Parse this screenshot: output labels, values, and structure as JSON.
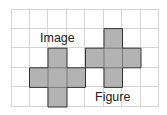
{
  "grid": {
    "columns": 8,
    "rows": 5,
    "origin_x": 11,
    "origin_y": 9,
    "cell_w": 18.5,
    "cell_h": 19.6,
    "line_color": "#d4d4d4"
  },
  "shapes": [
    {
      "name": "image-cross",
      "fill": "#b3b3b3",
      "stroke": "#333333",
      "cells": [
        [
          2,
          2
        ],
        [
          1,
          3
        ],
        [
          2,
          3
        ],
        [
          3,
          3
        ],
        [
          2,
          4
        ]
      ]
    },
    {
      "name": "figure-cross",
      "fill": "#b3b3b3",
      "stroke": "#333333",
      "cells": [
        [
          5,
          1
        ],
        [
          4,
          2
        ],
        [
          5,
          2
        ],
        [
          6,
          2
        ],
        [
          5,
          3
        ]
      ]
    }
  ],
  "labels": {
    "image": "Image",
    "figure": "Figure"
  }
}
